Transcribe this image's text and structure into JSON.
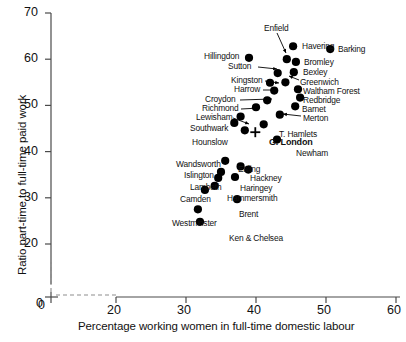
{
  "chart_data": {
    "type": "scatter",
    "title": "",
    "xlabel": "Percentage working women in full-time domestic labour",
    "ylabel": "Ratio part-time to full-time paid work",
    "xlim": [
      20,
      60
    ],
    "ylim": [
      20,
      70
    ],
    "xticks": [
      0,
      20,
      30,
      40,
      50,
      60
    ],
    "yticks": [
      0,
      20,
      30,
      40,
      50,
      60,
      70
    ],
    "axis_break": true,
    "grid": false,
    "legend": null,
    "points": [
      {
        "label": "Enfield",
        "x": 44.4,
        "y": 60.0,
        "marker": "dot",
        "label_pos": "callout-up",
        "label_x": 264,
        "label_y": 24,
        "arrow": [
          [
            277,
            33
          ],
          [
            286,
            53
          ]
        ]
      },
      {
        "label": "Havering",
        "x": 45.3,
        "y": 62.8,
        "marker": "dot",
        "label_pos": "right",
        "label_x": 302,
        "label_y": 42
      },
      {
        "label": "Barking",
        "x": 50.6,
        "y": 62.2,
        "marker": "dot",
        "label_pos": "right",
        "label_x": 338,
        "label_y": 45
      },
      {
        "label": "Hillingdon",
        "x": 39.0,
        "y": 60.3,
        "marker": "dot",
        "label_pos": "left",
        "label_x": 204,
        "label_y": 52
      },
      {
        "label": "Bromley",
        "x": 45.7,
        "y": 59.4,
        "marker": "dot",
        "label_pos": "right",
        "label_x": 304,
        "label_y": 58
      },
      {
        "label": "Sutton",
        "x": 43.1,
        "y": 57.0,
        "marker": "dot",
        "label_pos": "leader-left",
        "label_x": 228,
        "label_y": 62,
        "arrow": [
          [
            258,
            67
          ],
          [
            277,
            69
          ]
        ]
      },
      {
        "label": "Bexley",
        "x": 45.4,
        "y": 57.2,
        "marker": "dot",
        "label_pos": "right",
        "label_x": 303,
        "label_y": 68
      },
      {
        "label": "Greenwich",
        "x": 44.2,
        "y": 55.0,
        "marker": "dot",
        "label_pos": "leader",
        "label_x": 300,
        "label_y": 78,
        "arrow": [
          [
            299,
            80
          ],
          [
            289,
            76
          ]
        ]
      },
      {
        "label": "Kingston",
        "x": 42.0,
        "y": 54.9,
        "marker": "dot",
        "label_pos": "leader-left",
        "label_x": 231,
        "label_y": 76,
        "arrow": [
          [
            265,
            81
          ],
          [
            279,
            83
          ]
        ]
      },
      {
        "label": "Waltham Forest",
        "x": 46.0,
        "y": 53.5,
        "marker": "dot",
        "label_pos": "right",
        "label_x": 303,
        "label_y": 87
      },
      {
        "label": "Harrow",
        "x": 42.6,
        "y": 53.2,
        "marker": "dot",
        "label_pos": "leader-left",
        "label_x": 234,
        "label_y": 85,
        "arrow": [
          [
            263,
            90
          ],
          [
            276,
            90
          ]
        ]
      },
      {
        "label": "Redbridge",
        "x": 46.3,
        "y": 51.7,
        "marker": "dot",
        "label_pos": "right",
        "label_x": 303,
        "label_y": 96
      },
      {
        "label": "Croydon",
        "x": 41.6,
        "y": 51.1,
        "marker": "dot",
        "label_pos": "leader-left",
        "label_x": 205,
        "label_y": 95,
        "arrow": [
          [
            240,
            100
          ],
          [
            272,
            99
          ]
        ]
      },
      {
        "label": "Barnet",
        "x": 45.6,
        "y": 49.8,
        "marker": "dot",
        "label_pos": "right",
        "label_x": 302,
        "label_y": 105
      },
      {
        "label": "Richmond",
        "x": 40.0,
        "y": 49.6,
        "marker": "dot",
        "label_pos": "leader-left",
        "label_x": 202,
        "label_y": 104,
        "arrow": [
          [
            241,
            109
          ],
          [
            260,
            108
          ]
        ]
      },
      {
        "label": "Merton",
        "x": 43.4,
        "y": 48.0,
        "marker": "dot",
        "label_pos": "leader",
        "label_x": 303,
        "label_y": 114,
        "arrow": [
          [
            301,
            116
          ],
          [
            283,
            114
          ]
        ]
      },
      {
        "label": "Lewisham",
        "x": 37.8,
        "y": 47.6,
        "marker": "dot",
        "label_pos": "leader-left",
        "label_x": 196,
        "label_y": 113,
        "arrow": [
          [
            233,
            118
          ],
          [
            249,
            124
          ]
        ]
      },
      {
        "label": "Southwark",
        "x": 36.9,
        "y": 46.2,
        "marker": "dot",
        "label_pos": "left",
        "label_x": 190,
        "label_y": 124
      },
      {
        "label": "T. Hamlets",
        "x": 41.1,
        "y": 45.9,
        "marker": "dot",
        "label_pos": "right",
        "label_x": 279,
        "label_y": 130
      },
      {
        "label": "Hounslow",
        "x": 38.4,
        "y": 44.6,
        "marker": "dot",
        "label_pos": "left",
        "label_x": 192,
        "label_y": 138
      },
      {
        "label": "G. London",
        "x": 39.9,
        "y": 44.2,
        "marker": "cross",
        "label_pos": "right",
        "label_x": 269,
        "label_y": 138,
        "bold": true
      },
      {
        "label": "Newham",
        "x": 43.0,
        "y": 42.6,
        "marker": "dot",
        "label_pos": "right",
        "label_x": 296,
        "label_y": 149
      },
      {
        "label": "Wandsworth",
        "x": 35.6,
        "y": 38.0,
        "marker": "dot",
        "label_pos": "left",
        "label_x": 176,
        "label_y": 160
      },
      {
        "label": "Ealing",
        "x": 37.8,
        "y": 36.8,
        "marker": "dot",
        "label_pos": "right",
        "label_x": 238,
        "label_y": 165
      },
      {
        "label": "Hackney",
        "x": 38.9,
        "y": 36.1,
        "marker": "dot",
        "label_pos": "right",
        "label_x": 250,
        "label_y": 174
      },
      {
        "label": "Islington",
        "x": 35.0,
        "y": 35.6,
        "marker": "dot",
        "label_pos": "left",
        "label_x": 184,
        "label_y": 171
      },
      {
        "label": "Haringey",
        "x": 37.0,
        "y": 34.5,
        "marker": "dot",
        "label_pos": "right",
        "label_x": 240,
        "label_y": 184
      },
      {
        "label": "Lambeth",
        "x": 34.6,
        "y": 34.3,
        "marker": "dot",
        "label_pos": "left",
        "label_x": 190,
        "label_y": 183
      },
      {
        "label": "Hammersmith",
        "x": 34.1,
        "y": 32.6,
        "marker": "dot",
        "label_pos": "right",
        "label_x": 227,
        "label_y": 194
      },
      {
        "label": "Camden",
        "x": 32.7,
        "y": 31.7,
        "marker": "dot",
        "label_pos": "left",
        "label_x": 180,
        "label_y": 195
      },
      {
        "label": "Brent",
        "x": 37.3,
        "y": 29.7,
        "marker": "dot",
        "label_pos": "right",
        "label_x": 239,
        "label_y": 210
      },
      {
        "label": "Westminster",
        "x": 31.7,
        "y": 27.5,
        "marker": "dot",
        "label_pos": "left",
        "label_x": 172,
        "label_y": 219
      },
      {
        "label": "Ken & Chelsea",
        "x": 32.0,
        "y": 24.8,
        "marker": "dot",
        "label_pos": "right",
        "label_x": 229,
        "label_y": 234
      }
    ]
  },
  "axes": {
    "x_tick_labels": [
      "0",
      "20",
      "30",
      "40",
      "50",
      "60"
    ],
    "y_tick_labels": [
      "0",
      "20",
      "30",
      "40",
      "50",
      "60",
      "70"
    ],
    "x_title": "Percentage working women in full-time domestic labour",
    "y_title": "Ratio part-time to full-time paid work"
  }
}
